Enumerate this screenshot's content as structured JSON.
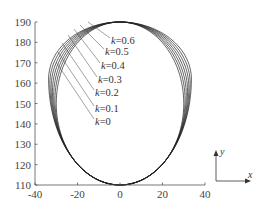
{
  "chart_data": {
    "type": "line",
    "title": "",
    "xlabel": "",
    "ylabel": "",
    "xlim": [
      -40,
      40
    ],
    "ylim": [
      110,
      190
    ],
    "x_ticks": [
      -40,
      -20,
      0,
      20,
      40
    ],
    "y_ticks": [
      110,
      120,
      130,
      140,
      150,
      160,
      170,
      180,
      190
    ],
    "grid": false,
    "legend": "inline leader-line labels",
    "series": [
      {
        "name": "k=0",
        "k": 0.0,
        "shape": "closed egg curve",
        "top": [
          0,
          190
        ],
        "bottom": [
          0,
          110
        ],
        "half_width": 30,
        "widest_y": 150
      },
      {
        "name": "k=0.1",
        "k": 0.1,
        "shape": "closed egg curve",
        "top": [
          0,
          190
        ],
        "bottom": [
          0,
          110
        ],
        "half_width": 30,
        "widest_y": 152
      },
      {
        "name": "k=0.2",
        "k": 0.2,
        "shape": "closed egg curve",
        "top": [
          0,
          190
        ],
        "bottom": [
          0,
          110
        ],
        "half_width": 30,
        "widest_y": 154
      },
      {
        "name": "k=0.3",
        "k": 0.3,
        "shape": "closed egg curve",
        "top": [
          0,
          190
        ],
        "bottom": [
          0,
          110
        ],
        "half_width": 30,
        "widest_y": 156
      },
      {
        "name": "k=0.4",
        "k": 0.4,
        "shape": "closed egg curve",
        "top": [
          0,
          190
        ],
        "bottom": [
          0,
          110
        ],
        "half_width": 30,
        "widest_y": 158
      },
      {
        "name": "k=0.5",
        "k": 0.5,
        "shape": "closed egg curve",
        "top": [
          0,
          190
        ],
        "bottom": [
          0,
          110
        ],
        "half_width": 30,
        "widest_y": 160
      },
      {
        "name": "k=0.6",
        "k": 0.6,
        "shape": "closed egg curve",
        "top": [
          0,
          190
        ],
        "bottom": [
          0,
          110
        ],
        "half_width": 30,
        "widest_y": 162
      }
    ],
    "annotations": [
      "k=0.6",
      "k=0.5",
      "k=0.4",
      "k=0.3",
      "k=0.2",
      "k=0.1",
      "k=0"
    ],
    "coordinate_indicator": {
      "x_label": "x",
      "y_label": "y"
    }
  },
  "labels": {
    "k_prefix": "k",
    "items": [
      "=0.6",
      "=0.5",
      "=0.4",
      "=0.3",
      "=0.2",
      "=0.1",
      "=0"
    ]
  },
  "axes": {
    "x_ticks": [
      "-40",
      "-20",
      "0",
      "20",
      "40"
    ],
    "y_ticks": [
      "190",
      "180",
      "170",
      "160",
      "150",
      "140",
      "130",
      "120",
      "110"
    ],
    "indicator_x": "x",
    "indicator_y": "y"
  },
  "colors": {
    "curve": "#222222",
    "axis": "#555555",
    "text": "#333333"
  }
}
